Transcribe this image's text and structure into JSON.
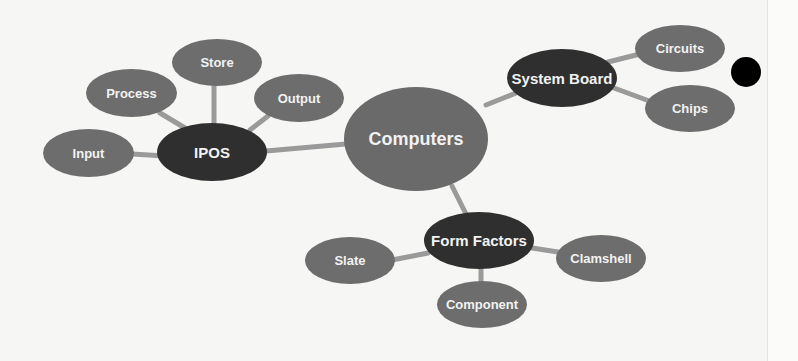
{
  "diagram": {
    "type": "mind-map",
    "colors": {
      "background": "#f6f6f4",
      "leaf_fill": "#6d6d6d",
      "hub_fill": "#2f2f2f",
      "center_fill": "#6a6a6a",
      "connector": "#9a9a9a",
      "text": "#f2f2f2"
    },
    "center": {
      "label": "Computers"
    },
    "hubs": [
      {
        "label": "IPOS",
        "children": [
          "Input",
          "Process",
          "Store",
          "Output"
        ]
      },
      {
        "label": "System Board",
        "children": [
          "Circuits",
          "Chips"
        ]
      },
      {
        "label": "Form Factors",
        "children": [
          "Slate",
          "Component",
          "Clamshell"
        ]
      }
    ],
    "nodes": {
      "computers": "Computers",
      "ipos": "IPOS",
      "input": "Input",
      "process": "Process",
      "store": "Store",
      "output": "Output",
      "system_board": "System Board",
      "circuits": "Circuits",
      "chips": "Chips",
      "form_factors": "Form Factors",
      "slate": "Slate",
      "component": "Component",
      "clamshell": "Clamshell"
    }
  }
}
